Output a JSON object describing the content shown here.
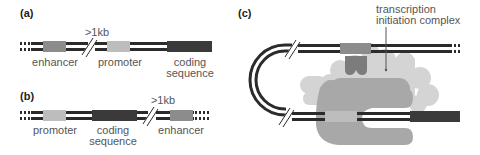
{
  "figure": {
    "colors": {
      "dna_strand": "#2b2b2b",
      "enhancer": "#8c8c8c",
      "promoter": "#bdbdbd",
      "coding_sequence": "#3a3a3a",
      "complex_light": "#d2d2d2",
      "complex_mid": "#a6a6a6",
      "activator": "#7a7a7a",
      "text": "#555555"
    },
    "panel_a": {
      "label": "(a)",
      "distance": ">1kb",
      "enhancer": "enhancer",
      "promoter": "promoter",
      "coding_line1": "coding",
      "coding_line2": "sequence"
    },
    "panel_b": {
      "label": "(b)",
      "distance": ">1kb",
      "promoter": "promoter",
      "coding_line1": "coding",
      "coding_line2": "sequence",
      "enhancer": "enhancer"
    },
    "panel_c": {
      "label": "(c)",
      "complex_line1": "transcription",
      "complex_line2": "initiation complex"
    }
  }
}
